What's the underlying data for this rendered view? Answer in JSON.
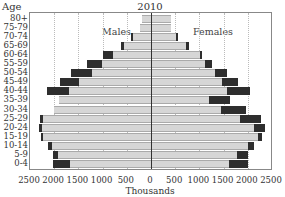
{
  "chart_data": {
    "type": "bar",
    "subtype": "population-pyramid",
    "title": "2010",
    "ylabel": "Age",
    "xlabel": "Thousands",
    "xlim": [
      -2500,
      2500
    ],
    "x_ticks": [
      "2500",
      "2000",
      "1500",
      "1000",
      "500",
      "0",
      "500",
      "1000",
      "1500",
      "2000",
      "2500"
    ],
    "grid": "vertical dotted",
    "annotations": [
      "Males",
      "Females"
    ],
    "categories": [
      "80+",
      "75-79",
      "70-74",
      "65-69",
      "60-64",
      "55-59",
      "50-54",
      "45-49",
      "40-44",
      "35-39",
      "30-34",
      "25-29",
      "20-24",
      "15-19",
      "10-14",
      "5-9",
      "0-4"
    ],
    "series": [
      {
        "name": "Males (light segment)",
        "side": "left",
        "color": "#d6d6d6",
        "values": [
          190,
          230,
          380,
          560,
          780,
          1020,
          1220,
          1480,
          1700,
          1900,
          2000,
          2230,
          2260,
          2230,
          2050,
          1920,
          1680
        ]
      },
      {
        "name": "Males (dark segment, total extent)",
        "side": "left",
        "color": "#2e2e2e",
        "values": [
          190,
          230,
          420,
          630,
          1000,
          1320,
          1650,
          1890,
          2150,
          1560,
          2000,
          2300,
          2320,
          2280,
          2120,
          2020,
          2030
        ]
      },
      {
        "name": "Females (light segment)",
        "side": "right",
        "color": "#d6d6d6",
        "values": [
          420,
          420,
          520,
          720,
          1020,
          1120,
          1320,
          1470,
          1560,
          1200,
          1450,
          1830,
          2130,
          2210,
          2000,
          1780,
          1610
        ]
      },
      {
        "name": "Females (dark segment, total extent)",
        "side": "right",
        "color": "#2e2e2e",
        "values": [
          420,
          420,
          560,
          790,
          1050,
          1260,
          1560,
          1800,
          2050,
          1640,
          1960,
          2280,
          2350,
          2290,
          2120,
          2000,
          2000
        ]
      }
    ]
  },
  "labels": {
    "title": "2010",
    "age": "Age",
    "males": "Males",
    "females": "Females",
    "thousands": "Thousands"
  }
}
